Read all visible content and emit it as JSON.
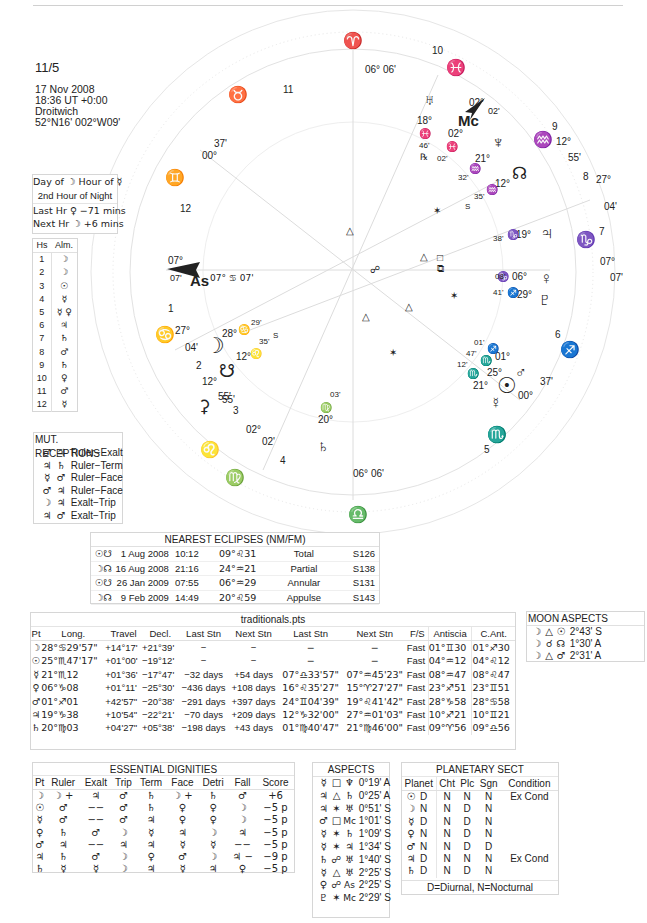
{
  "header": {
    "title": "11/5",
    "date": "17 Nov 2008",
    "time": "18:36  UT +0:00",
    "place": "Droitwich",
    "coords": "52°N16' 002°W09'"
  },
  "planetary_hours": {
    "line1": "Day of ☽  Hour of ☿",
    "line2": "2nd Hour of Night",
    "line3": "Last Hr ♀ −71 mins",
    "line4": "Next Hr ☽ +6 mins"
  },
  "almuten": {
    "headers": [
      "Hs",
      "Alm."
    ],
    "rows": [
      [
        "1",
        "☽"
      ],
      [
        "2",
        "☽"
      ],
      [
        "3",
        "☉"
      ],
      [
        "4",
        "☿"
      ],
      [
        "5",
        "☿ ♀"
      ],
      [
        "6",
        "♃"
      ],
      [
        "7",
        "♄"
      ],
      [
        "8",
        "♂"
      ],
      [
        "9",
        "♄"
      ],
      [
        "10",
        "♀"
      ],
      [
        "11",
        "♂"
      ],
      [
        "12",
        "☿"
      ]
    ]
  },
  "mutual_receptions": {
    "title": "MUT. RECEPTIONS",
    "rows": [
      {
        "a": "♂",
        "b": "♃",
        "type": "Ruler−Exalt"
      },
      {
        "a": "♃",
        "b": "♄",
        "type": "Ruler−Term"
      },
      {
        "a": "☿",
        "b": "♂",
        "type": "Ruler−Face"
      },
      {
        "a": "♂",
        "b": "♃",
        "type": "Ruler−Face"
      },
      {
        "a": "☽",
        "b": "♃",
        "type": "Exalt−Trip"
      },
      {
        "a": "♃",
        "b": "♂",
        "type": "Exalt−Trip"
      }
    ]
  },
  "eclipses": {
    "title": "NEAREST ECLIPSES (NM/FM)",
    "rows": [
      {
        "lum": "☉",
        "node": "☋",
        "date": "1 Aug 2008",
        "time": "10:12",
        "pos": "09°♌31",
        "kind": "Total",
        "saros": "S126"
      },
      {
        "lum": "☽",
        "node": "☊",
        "date": "16 Aug 2008",
        "time": "21:16",
        "pos": "24°♒21",
        "kind": "Partial",
        "saros": "S138"
      },
      {
        "lum": "☉",
        "node": "☋",
        "date": "26 Jan 2009",
        "time": "07:55",
        "pos": "06°♒29",
        "kind": "Annular",
        "saros": "S131"
      },
      {
        "lum": "☽",
        "node": "☊",
        "date": "9 Feb 2009",
        "time": "14:49",
        "pos": "20°♌59",
        "kind": "Appulse",
        "saros": "S143"
      }
    ]
  },
  "traditionals": {
    "title": "traditionals.pts",
    "headers": [
      "Pt",
      "Long.",
      "Travel",
      "Decl.",
      "Last Stn",
      "Next Stn",
      "Last Stn",
      "Next Stn",
      "F/S",
      "Antiscia",
      "C.Ant."
    ],
    "rows": [
      [
        "☽",
        "28°♋29'57\"",
        "+14°17'",
        "+21°39'",
        "−",
        "−",
        "−",
        "−",
        "Fast",
        "01°♊30",
        "01°♐30"
      ],
      [
        "☉",
        "25°♏47'17\"",
        "+01°00'",
        "−19°12'",
        "−",
        "−",
        "−",
        "−",
        "Fast",
        "04°♒12",
        "04°♌12"
      ],
      [
        "☿",
        "21°♏12",
        "+01°36'",
        "−17°47'",
        "−32 days",
        "+54 days",
        "07°♎33'57\"",
        "07°♒45'23\"",
        "Fast",
        "08°♒47",
        "08°♌47"
      ],
      [
        "♀",
        "06°♑08",
        "+01°11'",
        "−25°30'",
        "−436 days",
        "+108 days",
        "16°♌35'27\"",
        "15°♈27'27\"",
        "Fast",
        "23°♐51",
        "23°♊51"
      ],
      [
        "♂",
        "01°♐01",
        "+42'57\"",
        "−20°38'",
        "−291 days",
        "+397 days",
        "24°♊04'39\"",
        "19°♌41'42\"",
        "Fast",
        "28°♑58",
        "28°♋58"
      ],
      [
        "♃",
        "19°♑38",
        "+10'54\"",
        "−22°21'",
        "−70 days",
        "+209 days",
        "12°♑32'00\"",
        "27°♒01'03\"",
        "Fast",
        "10°♐21",
        "10°♊21"
      ],
      [
        "♄",
        "20°♍03",
        "+04'27\"",
        "+05°38'",
        "−198 days",
        "+43 days",
        "01°♍40'47\"",
        "21°♍46'00\"",
        "Fast",
        "09°♈56",
        "09°♎56"
      ]
    ]
  },
  "moon_aspects": {
    "title": "MOON ASPECTS",
    "rows": [
      {
        "p1": "☽",
        "asp": "△",
        "p2": "☉",
        "orb": "2°43' S"
      },
      {
        "p1": "☽",
        "asp": "☌",
        "p2": "☊",
        "orb": "1°30' A"
      },
      {
        "p1": "☽",
        "asp": "△",
        "p2": "♂",
        "orb": "2°31' A"
      }
    ]
  },
  "dignities": {
    "title": "ESSENTIAL DIGNITIES",
    "headers": [
      "Pt",
      "Ruler",
      "Exalt",
      "Trip",
      "Term",
      "Face",
      "Detri",
      "Fall",
      "Score"
    ],
    "rows": [
      [
        "☽",
        "☽ +",
        "♃",
        "♂",
        "♄",
        "☽ +",
        "♄",
        "♂",
        "+6"
      ],
      [
        "☉",
        "♂",
        "−−",
        "♂",
        "♄",
        "♀",
        "♀",
        "☽",
        "−5 p"
      ],
      [
        "☿",
        "♂",
        "−−",
        "♂",
        "♃",
        "♀",
        "♀",
        "☽",
        "−5 p"
      ],
      [
        "♀",
        "♄",
        "♂",
        "☽",
        "☿",
        "♃",
        "☽",
        "♃",
        "−5 p"
      ],
      [
        "♂",
        "♃",
        "−−",
        "♃",
        "♃",
        "☿",
        "☿",
        "−−",
        "−5 p"
      ],
      [
        "♃",
        "♄",
        "♂",
        "☽",
        "♀",
        "♂",
        "☽",
        "♃ −",
        "−9 p"
      ],
      [
        "♄",
        "☿",
        "☿",
        "☽",
        "♃",
        "☿",
        "♃",
        "♀",
        "−5 p"
      ]
    ]
  },
  "aspects": {
    "title": "ASPECTS",
    "rows": [
      {
        "p1": "☿",
        "asp": "□",
        "p2": "♆",
        "orb": "0°19' A"
      },
      {
        "p1": "♃",
        "asp": "△",
        "p2": "♄",
        "orb": "0°25' A"
      },
      {
        "p1": "♃",
        "asp": "✶",
        "p2": "♅",
        "orb": "0°51' S"
      },
      {
        "p1": "♂",
        "asp": "□",
        "p2": "Mc",
        "orb": "1°01' S"
      },
      {
        "p1": "☿",
        "asp": "✶",
        "p2": "♄",
        "orb": "1°09' S"
      },
      {
        "p1": "☿",
        "asp": "✶",
        "p2": "♃",
        "orb": "1°34' S"
      },
      {
        "p1": "♄",
        "asp": "☍",
        "p2": "♅",
        "orb": "1°40' S"
      },
      {
        "p1": "☿",
        "asp": "△",
        "p2": "♅",
        "orb": "2°25' S"
      },
      {
        "p1": "♀",
        "asp": "☍",
        "p2": "As",
        "orb": "2°25' S"
      },
      {
        "p1": "♇",
        "asp": "✶",
        "p2": "Mc",
        "orb": "2°29' S"
      }
    ]
  },
  "sect": {
    "title": "PLANETARY SECT",
    "headers": [
      "Planet",
      "Cht",
      "Plc",
      "Sgn",
      "Condition"
    ],
    "rows": [
      [
        "☉",
        "D",
        "N",
        "N",
        "N",
        "Ex Cond"
      ],
      [
        "☽",
        "N",
        "N",
        "D",
        "N",
        ""
      ],
      [
        "☿",
        "D",
        "N",
        "D",
        "N",
        ""
      ],
      [
        "♀",
        "N",
        "N",
        "D",
        "N",
        ""
      ],
      [
        "♂",
        "N",
        "N",
        "D",
        "D",
        ""
      ],
      [
        "♃",
        "D",
        "N",
        "N",
        "N",
        "Ex Cond"
      ],
      [
        "♄",
        "D",
        "N",
        "D",
        "N",
        ""
      ]
    ],
    "footer": "D=Diurnal, N=Nocturnal"
  },
  "wheel": {
    "signs": {
      "aries": "♈",
      "taurus": "♉",
      "gemini": "♊",
      "cancer": "♋",
      "leo": "♌",
      "virgo": "♍",
      "libra": "♎",
      "scorpio": "♏",
      "sagittarius": "♐",
      "capricorn": "♑",
      "aquarius": "♒",
      "pisces": "♓"
    },
    "cusp_top": "06° 06'",
    "cusp_bottom": "06° 06'",
    "house_numbers": [
      "1",
      "2",
      "3",
      "4",
      "5",
      "6",
      "7",
      "8",
      "9",
      "10",
      "11",
      "12"
    ],
    "asc": {
      "label": "As",
      "deg": "07°",
      "min": "07'",
      "inner": "07° ♋ 07'"
    },
    "mc": {
      "label": "Mc",
      "deg": "02°",
      "min": "02'"
    },
    "cusp_labels": {
      "c12_deg": "00°",
      "c12_min": "37'",
      "c2_deg": "27°",
      "c2_min": "04'",
      "c3_deg": "12°",
      "c3_min": "55'",
      "c4_deg": "02°",
      "c4_min": "02'",
      "c8_deg": "27°",
      "c8_min": "04'",
      "c9_deg": "12°",
      "c9_min": "55'",
      "c7_deg": "07°",
      "c7_min": "07'"
    },
    "planets": {
      "uranus": {
        "glyph": "♅",
        "deg": "18°",
        "sign": "♓",
        "min": "46'",
        "retro": "℞"
      },
      "uranus_pisces2": {
        "deg": "02°",
        "sign": "♓",
        "min": "02'"
      },
      "neptune": {
        "glyph": "♆",
        "deg": "21°",
        "sign": "♒",
        "min": "32'"
      },
      "node": {
        "glyph": "☊",
        "deg": "12°",
        "sign": "♒",
        "min": "35'",
        "s": "S"
      },
      "jupiter": {
        "glyph": "♃",
        "deg": "19°",
        "sign": "♑",
        "min": "38'"
      },
      "venus": {
        "glyph": "♀",
        "deg": "06°",
        "sign": "♑",
        "min": "08'"
      },
      "pluto": {
        "glyph": "♇",
        "deg": "29°",
        "sign": "♐",
        "min": "41'"
      },
      "mars": {
        "glyph": "♂",
        "deg": "01°",
        "sign": "♐",
        "min": "01'"
      },
      "sun": {
        "glyph": "☉",
        "deg": "25°",
        "sign": "♏",
        "min": "47'"
      },
      "mercury": {
        "glyph": "☿",
        "deg": "21°",
        "sign": "♏",
        "min": "12'"
      },
      "moon": {
        "glyph": "☽",
        "deg": "28°",
        "sign": "♋",
        "min": "29'"
      },
      "snode": {
        "glyph": "☋",
        "deg": "12°",
        "sign": "♌",
        "min": "35'",
        "s": "S"
      },
      "saturn": {
        "glyph": "♄",
        "deg": "20°",
        "sign": "♍",
        "min": "03'"
      },
      "fortuna_cusp": {
        "deg": "00°",
        "min": "37'"
      }
    }
  }
}
